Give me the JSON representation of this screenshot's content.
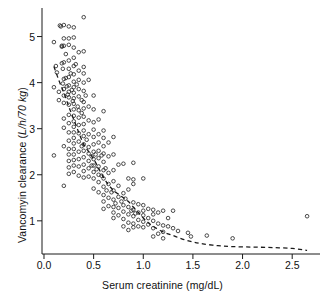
{
  "figure": {
    "kind": "scatter-plot",
    "background": "#ffffff",
    "ink_color": "#1a1a1a"
  },
  "axes": {
    "x_title_plain": "Serum creatinine (mg/dL)",
    "y_title_plain_part": "Vancomyin clearance (",
    "y_title_italic_part": "L/h/70 kg",
    "y_title_close": ")",
    "y_title_full": "Vancomyin clearance (L/h/70 kg)"
  },
  "chart_data": {
    "type": "scatter",
    "title": "",
    "xlabel": "Serum creatinine (mg/dL)",
    "ylabel": "Vancomyin clearance (L/h/70 kg)",
    "xlim": [
      -0.02,
      2.78
    ],
    "ylim": [
      0.28,
      5.62
    ],
    "grid": false,
    "legend": null,
    "xticks": [
      0.0,
      0.5,
      1.0,
      1.5,
      2.0,
      2.5
    ],
    "xtick_labels": [
      "0.0",
      "0.5",
      "1.0",
      "1.5",
      "2.0",
      "2.5"
    ],
    "yticks": [
      1,
      2,
      3,
      4,
      5
    ],
    "ytick_labels": [
      "1",
      "2",
      "3",
      "4",
      "5"
    ],
    "marker": "open-circle",
    "marker_size_px": 3.6,
    "marker_edge_color": "#2a2a2a",
    "marker_face_color": "none",
    "series": [
      {
        "name": "patients",
        "points": [
          [
            0.1,
            4.88
          ],
          [
            0.1,
            3.9
          ],
          [
            0.1,
            2.42
          ],
          [
            0.12,
            4.36
          ],
          [
            0.13,
            4.22
          ],
          [
            0.15,
            3.8
          ],
          [
            0.15,
            3.62
          ],
          [
            0.16,
            5.24
          ],
          [
            0.17,
            5.22
          ],
          [
            0.18,
            4.8
          ],
          [
            0.18,
            4.78
          ],
          [
            0.18,
            4.42
          ],
          [
            0.19,
            4.3
          ],
          [
            0.19,
            3.98
          ],
          [
            0.2,
            5.25
          ],
          [
            0.2,
            4.96
          ],
          [
            0.2,
            4.8
          ],
          [
            0.2,
            4.44
          ],
          [
            0.2,
            4.08
          ],
          [
            0.2,
            3.86
          ],
          [
            0.2,
            3.72
          ],
          [
            0.2,
            3.56
          ],
          [
            0.2,
            3.22
          ],
          [
            0.2,
            3.02
          ],
          [
            0.2,
            2.62
          ],
          [
            0.2,
            1.76
          ],
          [
            0.22,
            4.62
          ],
          [
            0.22,
            4.1
          ],
          [
            0.23,
            3.92
          ],
          [
            0.24,
            3.74
          ],
          [
            0.25,
            5.22
          ],
          [
            0.25,
            4.96
          ],
          [
            0.25,
            4.82
          ],
          [
            0.25,
            4.48
          ],
          [
            0.25,
            4.3
          ],
          [
            0.25,
            4.12
          ],
          [
            0.25,
            3.94
          ],
          [
            0.25,
            3.8
          ],
          [
            0.25,
            3.68
          ],
          [
            0.25,
            3.52
          ],
          [
            0.25,
            3.3
          ],
          [
            0.25,
            3.12
          ],
          [
            0.25,
            2.92
          ],
          [
            0.25,
            2.74
          ],
          [
            0.25,
            2.56
          ],
          [
            0.25,
            2.44
          ],
          [
            0.25,
            2.3
          ],
          [
            0.25,
            2.16
          ],
          [
            0.25,
            2.02
          ],
          [
            0.27,
            4.2
          ],
          [
            0.28,
            3.84
          ],
          [
            0.29,
            3.6
          ],
          [
            0.3,
            5.2
          ],
          [
            0.3,
            4.98
          ],
          [
            0.3,
            4.76
          ],
          [
            0.3,
            4.54
          ],
          [
            0.3,
            4.36
          ],
          [
            0.3,
            4.18
          ],
          [
            0.3,
            4.02
          ],
          [
            0.3,
            3.9
          ],
          [
            0.3,
            3.78
          ],
          [
            0.3,
            3.66
          ],
          [
            0.3,
            3.54
          ],
          [
            0.3,
            3.42
          ],
          [
            0.3,
            3.28
          ],
          [
            0.3,
            3.16
          ],
          [
            0.3,
            3.04
          ],
          [
            0.3,
            2.92
          ],
          [
            0.3,
            2.8
          ],
          [
            0.3,
            2.68
          ],
          [
            0.3,
            2.56
          ],
          [
            0.3,
            2.44
          ],
          [
            0.3,
            2.32
          ],
          [
            0.3,
            2.2
          ],
          [
            0.3,
            2.06
          ],
          [
            0.32,
            4.4
          ],
          [
            0.33,
            3.96
          ],
          [
            0.34,
            3.48
          ],
          [
            0.35,
            4.66
          ],
          [
            0.35,
            4.26
          ],
          [
            0.35,
            4.06
          ],
          [
            0.35,
            3.86
          ],
          [
            0.35,
            3.7
          ],
          [
            0.35,
            3.4
          ],
          [
            0.35,
            3.24
          ],
          [
            0.35,
            3.08
          ],
          [
            0.35,
            2.9
          ],
          [
            0.35,
            2.72
          ],
          [
            0.35,
            2.5
          ],
          [
            0.35,
            2.34
          ],
          [
            0.35,
            2.18
          ],
          [
            0.35,
            1.98
          ],
          [
            0.38,
            3.62
          ],
          [
            0.38,
            3.34
          ],
          [
            0.38,
            2.62
          ],
          [
            0.4,
            5.42
          ],
          [
            0.4,
            4.68
          ],
          [
            0.4,
            4.34
          ],
          [
            0.4,
            4.2
          ],
          [
            0.4,
            4.0
          ],
          [
            0.4,
            3.82
          ],
          [
            0.4,
            3.58
          ],
          [
            0.4,
            3.44
          ],
          [
            0.4,
            3.26
          ],
          [
            0.4,
            3.1
          ],
          [
            0.4,
            2.96
          ],
          [
            0.4,
            2.84
          ],
          [
            0.4,
            2.66
          ],
          [
            0.4,
            2.52
          ],
          [
            0.4,
            2.38
          ],
          [
            0.4,
            2.22
          ],
          [
            0.4,
            2.08
          ],
          [
            0.4,
            1.94
          ],
          [
            0.42,
            3.72
          ],
          [
            0.43,
            2.76
          ],
          [
            0.45,
            4.06
          ],
          [
            0.45,
            3.48
          ],
          [
            0.45,
            3.18
          ],
          [
            0.45,
            2.88
          ],
          [
            0.45,
            2.6
          ],
          [
            0.45,
            2.46
          ],
          [
            0.45,
            2.3
          ],
          [
            0.45,
            2.14
          ],
          [
            0.45,
            1.96
          ],
          [
            0.48,
            2.4
          ],
          [
            0.48,
            2.2
          ],
          [
            0.5,
            3.72
          ],
          [
            0.5,
            3.42
          ],
          [
            0.5,
            3.14
          ],
          [
            0.5,
            2.98
          ],
          [
            0.5,
            2.82
          ],
          [
            0.5,
            2.66
          ],
          [
            0.5,
            2.5
          ],
          [
            0.5,
            2.34
          ],
          [
            0.5,
            2.2
          ],
          [
            0.5,
            2.06
          ],
          [
            0.5,
            1.92
          ],
          [
            0.5,
            1.7
          ],
          [
            0.52,
            2.44
          ],
          [
            0.53,
            2.12
          ],
          [
            0.55,
            3.2
          ],
          [
            0.55,
            2.88
          ],
          [
            0.55,
            2.7
          ],
          [
            0.55,
            2.52
          ],
          [
            0.55,
            2.36
          ],
          [
            0.55,
            2.18
          ],
          [
            0.55,
            2.0
          ],
          [
            0.55,
            1.84
          ],
          [
            0.55,
            1.62
          ],
          [
            0.58,
            2.42
          ],
          [
            0.58,
            1.98
          ],
          [
            0.6,
            3.38
          ],
          [
            0.6,
            2.96
          ],
          [
            0.6,
            2.8
          ],
          [
            0.6,
            2.62
          ],
          [
            0.6,
            2.46
          ],
          [
            0.6,
            2.28
          ],
          [
            0.6,
            2.1
          ],
          [
            0.6,
            1.92
          ],
          [
            0.6,
            1.74
          ],
          [
            0.6,
            1.56
          ],
          [
            0.6,
            1.42
          ],
          [
            0.6,
            1.26
          ],
          [
            0.62,
            2.14
          ],
          [
            0.63,
            1.66
          ],
          [
            0.65,
            2.7
          ],
          [
            0.65,
            2.4
          ],
          [
            0.65,
            2.04
          ],
          [
            0.65,
            1.8
          ],
          [
            0.65,
            1.5
          ],
          [
            0.65,
            1.32
          ],
          [
            0.68,
            1.62
          ],
          [
            0.7,
            2.82
          ],
          [
            0.7,
            2.44
          ],
          [
            0.7,
            2.1
          ],
          [
            0.7,
            1.86
          ],
          [
            0.7,
            1.66
          ],
          [
            0.7,
            1.46
          ],
          [
            0.7,
            1.3
          ],
          [
            0.7,
            1.18
          ],
          [
            0.7,
            1.06
          ],
          [
            0.72,
            1.38
          ],
          [
            0.75,
            2.22
          ],
          [
            0.75,
            1.76
          ],
          [
            0.75,
            1.52
          ],
          [
            0.75,
            1.28
          ],
          [
            0.75,
            1.12
          ],
          [
            0.78,
            1.42
          ],
          [
            0.8,
            2.24
          ],
          [
            0.8,
            1.6
          ],
          [
            0.8,
            1.34
          ],
          [
            0.8,
            1.2
          ],
          [
            0.8,
            1.04
          ],
          [
            0.8,
            0.88
          ],
          [
            0.82,
            1.48
          ],
          [
            0.85,
            1.92
          ],
          [
            0.85,
            1.68
          ],
          [
            0.85,
            1.3
          ],
          [
            0.85,
            1.14
          ],
          [
            0.85,
            0.96
          ],
          [
            0.85,
            0.8
          ],
          [
            0.88,
            1.22
          ],
          [
            0.9,
            2.26
          ],
          [
            0.9,
            1.9
          ],
          [
            0.9,
            1.8
          ],
          [
            0.9,
            1.4
          ],
          [
            0.9,
            1.24
          ],
          [
            0.9,
            1.1
          ],
          [
            0.9,
            0.94
          ],
          [
            0.9,
            0.86
          ],
          [
            0.92,
            1.16
          ],
          [
            0.95,
            1.36
          ],
          [
            0.95,
            1.18
          ],
          [
            0.95,
            1.02
          ],
          [
            0.95,
            0.88
          ],
          [
            1.0,
            1.92
          ],
          [
            1.0,
            1.34
          ],
          [
            1.0,
            1.22
          ],
          [
            1.0,
            1.12
          ],
          [
            1.0,
            0.98
          ],
          [
            1.0,
            0.86
          ],
          [
            1.05,
            1.26
          ],
          [
            1.05,
            1.06
          ],
          [
            1.05,
            0.92
          ],
          [
            1.1,
            1.24
          ],
          [
            1.1,
            1.14
          ],
          [
            1.1,
            1.0
          ],
          [
            1.1,
            0.84
          ],
          [
            1.1,
            0.66
          ],
          [
            1.15,
            1.18
          ],
          [
            1.15,
            0.94
          ],
          [
            1.15,
            0.72
          ],
          [
            1.2,
            1.22
          ],
          [
            1.2,
            0.9
          ],
          [
            1.2,
            0.76
          ],
          [
            1.2,
            0.62
          ],
          [
            1.25,
            1.06
          ],
          [
            1.25,
            0.88
          ],
          [
            1.3,
            1.22
          ],
          [
            1.3,
            0.84
          ],
          [
            1.35,
            0.78
          ],
          [
            1.45,
            0.74
          ],
          [
            1.48,
            0.66
          ],
          [
            1.64,
            0.68
          ],
          [
            1.9,
            0.62
          ],
          [
            2.65,
            1.1
          ]
        ]
      }
    ],
    "fit_curve": {
      "name": "fitted-regression",
      "style": "dashed",
      "color": "#1a1a1a",
      "width_px": 1.3,
      "points": [
        [
          0.1,
          4.35
        ],
        [
          0.15,
          4.05
        ],
        [
          0.2,
          3.78
        ],
        [
          0.25,
          3.48
        ],
        [
          0.3,
          3.2
        ],
        [
          0.35,
          2.92
        ],
        [
          0.4,
          2.66
        ],
        [
          0.45,
          2.5
        ],
        [
          0.5,
          2.34
        ],
        [
          0.55,
          2.14
        ],
        [
          0.6,
          1.94
        ],
        [
          0.65,
          1.78
        ],
        [
          0.7,
          1.66
        ],
        [
          0.75,
          1.58
        ],
        [
          0.8,
          1.5
        ],
        [
          0.85,
          1.42
        ],
        [
          0.9,
          1.3
        ],
        [
          0.95,
          1.18
        ],
        [
          1.0,
          1.06
        ],
        [
          1.05,
          0.96
        ],
        [
          1.1,
          0.88
        ],
        [
          1.2,
          0.76
        ],
        [
          1.3,
          0.68
        ],
        [
          1.4,
          0.6
        ],
        [
          1.5,
          0.54
        ],
        [
          1.6,
          0.5
        ],
        [
          1.75,
          0.46
        ],
        [
          1.9,
          0.44
        ],
        [
          2.1,
          0.43
        ],
        [
          2.3,
          0.42
        ],
        [
          2.5,
          0.4
        ],
        [
          2.65,
          0.36
        ]
      ]
    }
  }
}
